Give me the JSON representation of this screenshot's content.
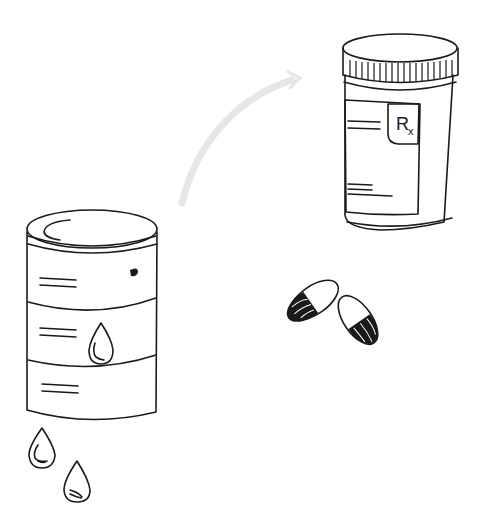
{
  "illustration": {
    "title": "Oil barrel to prescription medicine",
    "elements": [
      "oil-barrel",
      "oil-drops",
      "arrow",
      "pill-bottle",
      "capsules"
    ],
    "pill_bottle": {
      "label_text": "R",
      "label_subscript": "x"
    },
    "colors": {
      "line": "#1a1a1a",
      "grey_fill": "#d4d4d4",
      "arrow": "#e6e6e6",
      "background": "#ffffff"
    }
  }
}
